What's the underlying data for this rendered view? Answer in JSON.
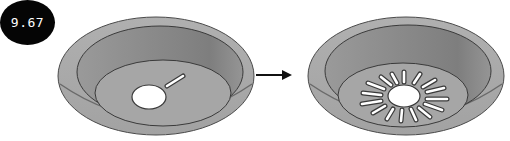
{
  "figure": {
    "label": "9.67",
    "panels": [
      {
        "name": "before",
        "description": "sink bowl with single drain hole and small slot"
      },
      {
        "name": "after",
        "description": "sink bowl with drain hole surrounded by radial slots"
      }
    ],
    "arrow": "right-arrow",
    "colors": {
      "rim": "#a9a9a9",
      "bowl_wall": "#8e8e8e",
      "bowl_floor": "#a4a4a4",
      "outline": "#3a3a3a",
      "hole": "#ffffff",
      "badge": "#050505",
      "badge_text": "#ffffff"
    }
  }
}
